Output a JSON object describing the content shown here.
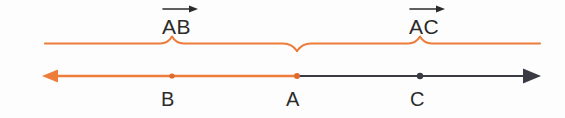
{
  "figure": {
    "background_color": "#fdfdfd",
    "width": 565,
    "height": 118
  },
  "colors": {
    "orange": "#ED7D3A",
    "orange_light": "#F0A070",
    "dark": "#3A3A42",
    "text": "#2b2b2b"
  },
  "vector_labels": [
    {
      "name": "vector-ab",
      "text": "AB",
      "arrow": "right-arrow-overbar",
      "x": 162,
      "y": 16
    },
    {
      "name": "vector-ac",
      "text": "AC",
      "arrow": "right-arrow-overbar",
      "x": 409,
      "y": 16
    }
  ],
  "braces": {
    "color": "#ED7D3A",
    "baseline_y": 42,
    "left_end_x": 45,
    "right_end_x": 540,
    "split_x": 297,
    "ab_peak_x": 172,
    "ac_peak_x": 420
  },
  "number_line": {
    "y": 76,
    "left_arrow_tip_x": 42,
    "right_arrow_tip_x": 541,
    "left_arrow_color": "#ED7D3A",
    "right_arrow_color": "#3A3A42",
    "orange_segment": {
      "from_x": 42,
      "to_x": 297
    },
    "dark_segment": {
      "from_x": 297,
      "to_x": 541
    }
  },
  "points": [
    {
      "name": "point-b",
      "label": "B",
      "x": 172,
      "dot_color": "#ED7D3A",
      "label_x": 161,
      "label_y": 89
    },
    {
      "name": "point-a",
      "label": "A",
      "x": 297,
      "dot_color": "#ED7D3A",
      "label_x": 286,
      "label_y": 89
    },
    {
      "name": "point-c",
      "label": "C",
      "x": 420,
      "dot_color": "#3A3A42",
      "label_x": 410,
      "label_y": 89
    }
  ]
}
